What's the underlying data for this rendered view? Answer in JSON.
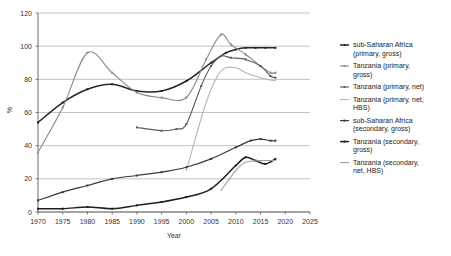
{
  "chart_data": {
    "type": "line",
    "title": "",
    "xlabel": "Year",
    "ylabel": "%",
    "xlim": [
      1970,
      2025
    ],
    "ylim": [
      0,
      120
    ],
    "xticks": [
      1970,
      1975,
      1980,
      1985,
      1990,
      1995,
      2000,
      2005,
      2010,
      2015,
      2020,
      2025
    ],
    "yticks": [
      0,
      20,
      40,
      60,
      80,
      100,
      120
    ],
    "grid": "horizontal",
    "legend_position": "right",
    "series": [
      {
        "name": "sub-Saharan Africa (primary, gross)",
        "color": "#262626",
        "width": 1.5,
        "markers": true,
        "x": [
          1970,
          1975,
          1980,
          1985,
          1990,
          1995,
          2000,
          2005,
          2008,
          2010,
          2012,
          2014,
          2016,
          2018
        ],
        "y": [
          54,
          66,
          74,
          77,
          73,
          73,
          79,
          90,
          96,
          98,
          99,
          99,
          99,
          99
        ]
      },
      {
        "name": "Tanzania (primary, gross)",
        "color": "#8a8a8a",
        "width": 1.1,
        "markers": true,
        "x": [
          1970,
          1975,
          1980,
          1985,
          1990,
          1995,
          2000,
          2004,
          2007,
          2009,
          2012,
          2015,
          2017,
          2018
        ],
        "y": [
          36,
          63,
          96,
          84,
          72,
          69,
          69,
          92,
          107,
          101,
          95,
          88,
          84,
          84
        ]
      },
      {
        "name": "Tanzania (primary, net)",
        "color": "#5c5c5c",
        "width": 1.1,
        "markers": true,
        "x": [
          1990,
          1995,
          1998,
          2000,
          2003,
          2005,
          2007,
          2009,
          2012,
          2015,
          2017,
          2018
        ],
        "y": [
          51,
          49,
          50,
          53,
          76,
          88,
          94,
          93,
          92,
          88,
          82,
          81
        ]
      },
      {
        "name": "Tanzania (primary, net, HBS)",
        "color": "#b5b5b5",
        "width": 1.1,
        "markers": false,
        "x": [
          2000,
          2004,
          2007,
          2010,
          2012,
          2015,
          2018
        ],
        "y": [
          25,
          66,
          85,
          87,
          84,
          81,
          79
        ]
      },
      {
        "name": "sub-Saharan Africa (secondary, gross)",
        "color": "#3a3a3a",
        "width": 1.2,
        "markers": true,
        "x": [
          1970,
          1975,
          1980,
          1985,
          1990,
          1995,
          2000,
          2005,
          2010,
          2013,
          2015,
          2017,
          2018
        ],
        "y": [
          7,
          12,
          16,
          20,
          22,
          24,
          27,
          32,
          39,
          43,
          44,
          43,
          43
        ]
      },
      {
        "name": "Tanzania (secondary, gross)",
        "color": "#1f1f1f",
        "width": 1.5,
        "markers": true,
        "x": [
          1970,
          1975,
          1980,
          1985,
          1990,
          1995,
          2000,
          2005,
          2010,
          2012,
          2014,
          2016,
          2018
        ],
        "y": [
          2,
          2,
          3,
          2,
          4,
          6,
          9,
          14,
          28,
          33,
          31,
          29,
          32
        ]
      },
      {
        "name": "Tanzania (secondary, net, HBS)",
        "color": "#9e9e9e",
        "width": 1.1,
        "markers": false,
        "x": [
          2007,
          2010,
          2012,
          2015,
          2018
        ],
        "y": [
          13,
          25,
          30,
          31,
          31
        ]
      }
    ]
  },
  "legend": {
    "entries": [
      "sub-Saharan Africa (primary, gross)",
      "Tanzania (primary, gross)",
      "Tanzania (primary, net)",
      "Tanzania (primary, net, HBS)",
      "sub-Saharan Africa (secondary, gross)",
      "Tanzania (secondary, gross)",
      "Tanzania (secondary, net, HBS)"
    ]
  }
}
